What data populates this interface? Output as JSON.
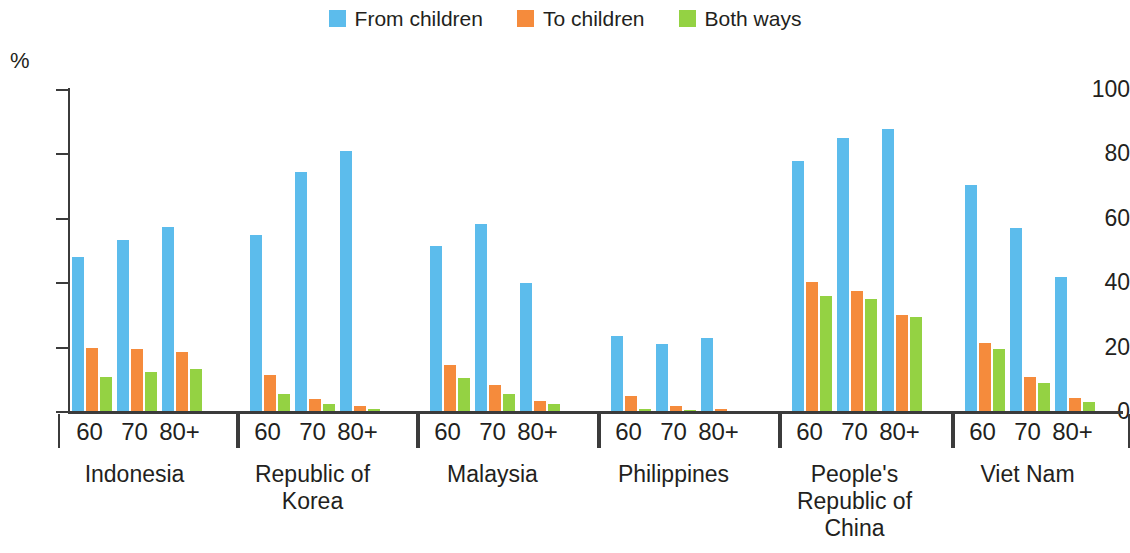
{
  "chart_data": {
    "type": "bar",
    "title": "",
    "subtitle": "",
    "xlabel": "",
    "ylabel": "%",
    "ylim": [
      0,
      100
    ],
    "yticks": [
      0,
      20,
      40,
      60,
      80,
      100
    ],
    "grid": false,
    "legend_position": "top-center",
    "categories": [
      "60",
      "70",
      "80+"
    ],
    "groups": [
      {
        "name": "Indonesia",
        "ages": [
          "60",
          "70",
          "80+"
        ],
        "values": {
          "From children": [
            48,
            53.5,
            57.5
          ],
          "To children": [
            20,
            19.5,
            18.5
          ],
          "Both ways": [
            11,
            12.5,
            13.5
          ]
        }
      },
      {
        "name": "Republic of Korea",
        "name_lines": [
          "Republic of",
          "Korea"
        ],
        "ages": [
          "60",
          "70",
          "80+"
        ],
        "values": {
          "From children": [
            55,
            74.5,
            81
          ],
          "To children": [
            11.5,
            4,
            2
          ],
          "Both ways": [
            5.5,
            2.5,
            1
          ]
        }
      },
      {
        "name": "Malaysia",
        "ages": [
          "60",
          "70",
          "80+"
        ],
        "values": {
          "From children": [
            51.5,
            58.5,
            40
          ],
          "To children": [
            14.5,
            8.5,
            3.5
          ],
          "Both ways": [
            10.5,
            5.5,
            2.5
          ]
        }
      },
      {
        "name": "Philippines",
        "ages": [
          "60",
          "70",
          "80+"
        ],
        "values": {
          "From children": [
            23.5,
            21,
            23
          ],
          "To children": [
            5,
            2,
            1
          ],
          "Both ways": [
            1,
            0.5,
            0
          ]
        }
      },
      {
        "name": "People's Republic of China",
        "name_lines": [
          "People's",
          "Republic of",
          "China"
        ],
        "ages": [
          "60",
          "70",
          "80+"
        ],
        "values": {
          "From children": [
            78,
            85,
            88
          ],
          "To children": [
            40.5,
            37.5,
            30
          ],
          "Both ways": [
            36,
            35,
            29.5
          ]
        }
      },
      {
        "name": "Viet Nam",
        "ages": [
          "60",
          "70",
          "80+"
        ],
        "values": {
          "From children": [
            70.5,
            57,
            42
          ],
          "To children": [
            21.5,
            11,
            4.5
          ],
          "Both ways": [
            19.5,
            9,
            3
          ]
        }
      }
    ],
    "series": [
      {
        "name": "From children",
        "color": "#5cbcec"
      },
      {
        "name": "To children",
        "color": "#f58b3c"
      },
      {
        "name": "Both ways",
        "color": "#94d243"
      }
    ]
  },
  "legend": {
    "items": [
      {
        "label": "From children",
        "color": "#5cbcec",
        "swatch": "legend-swatch-from-children"
      },
      {
        "label": "To children",
        "color": "#f58b3c",
        "swatch": "legend-swatch-to-children"
      },
      {
        "label": "Both ways",
        "color": "#94d243",
        "swatch": "legend-swatch-both-ways"
      }
    ]
  },
  "axis": {
    "unit_label": "%",
    "y_tick_labels": [
      "100",
      "80",
      "60",
      "40",
      "20",
      "0"
    ]
  }
}
